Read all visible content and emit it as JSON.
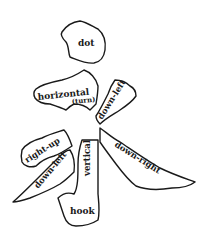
{
  "diagram": {
    "colors": {
      "stroke": "#1a1a1a",
      "background": "#ffffff"
    },
    "strokes": [
      {
        "id": "dot",
        "label": "dot"
      },
      {
        "id": "horizontal",
        "label": "horizontal",
        "sublabel": "(turn)"
      },
      {
        "id": "down-left-upper",
        "label": "down-left"
      },
      {
        "id": "down-right",
        "label": "down-right"
      },
      {
        "id": "right-up",
        "label": "right-up"
      },
      {
        "id": "down-left-lower",
        "label": "down-left"
      },
      {
        "id": "vertical",
        "label": "vertical"
      },
      {
        "id": "hook",
        "label": "hook"
      }
    ]
  }
}
